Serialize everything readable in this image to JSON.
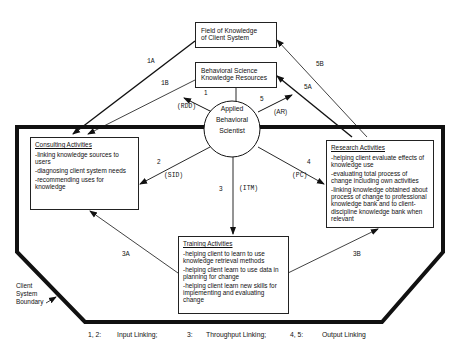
{
  "diagram": {
    "center": {
      "lines": [
        "Applied",
        "Behavioral",
        "Scientist"
      ]
    },
    "top_boxes": {
      "field": {
        "lines": [
          "Field of Knowledge",
          "of Client System"
        ]
      },
      "behavioral": {
        "lines": [
          "Behavioral Science",
          "Knowledge Resources"
        ]
      }
    },
    "activities": {
      "consulting": {
        "title": "Consulting Activities",
        "items": [
          "-linking knowledge sources to users",
          "-diagnosing client system needs",
          "-recommending uses for knowledge"
        ]
      },
      "research": {
        "title": "Research Activities",
        "items": [
          "-helping client evaluate effects of knowledge use",
          "-evaluating total process of change including own activities",
          "-linking knowledge obtained about process of change to professional knowledge bank and to client-discipline knowledge bank when relevant"
        ]
      },
      "training": {
        "title": "Training Activities",
        "items": [
          "-helping client to learn to use knowledge retrieval methods",
          "-helping client learn to use data in planning for change",
          "-helping client learn new skills for implementing and evaluating change"
        ]
      }
    },
    "edge_labels": {
      "1A": "1A",
      "1B": "1B",
      "5A": "5A",
      "5B": "5B",
      "1": "1",
      "RDD": "(RDD)",
      "5": "5",
      "AR": "(AR)",
      "2": "2",
      "SID": "(SID)",
      "3": "3",
      "ITM": "(ITM)",
      "4": "4",
      "PC": "(PC)",
      "3A": "3A",
      "3B": "3B"
    },
    "boundary_label": [
      "Client",
      "System",
      "Boundary"
    ],
    "legend": {
      "input_nums": "1, 2:",
      "input_label": "Input Linking;",
      "through_nums": "3:",
      "through_label": "Throughput Linking;",
      "output_nums": "4, 5:",
      "output_label": "Output Linking"
    },
    "colors": {
      "ink": "#111111",
      "background": "#ffffff"
    }
  }
}
